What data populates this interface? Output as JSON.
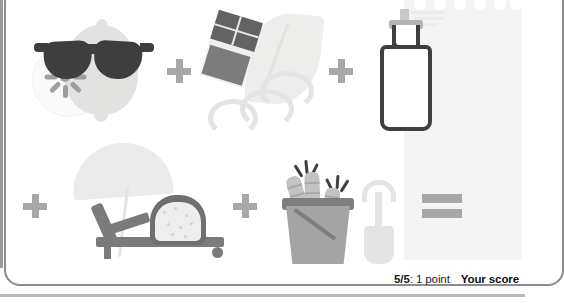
{
  "card": {
    "accent_gray": "#a8a8a8",
    "dark_ink": "#3e3e3e"
  },
  "puzzle": {
    "rows": [
      {
        "id": "row-1",
        "items": [
          {
            "type": "icon",
            "name": "lemon-sunglasses-icon",
            "label": "lemon wearing sunglasses"
          },
          {
            "type": "operator",
            "name": "plus-operator",
            "label": "+"
          },
          {
            "type": "icon",
            "name": "chocolate-feather-icon",
            "label": "chocolate bar with feather"
          },
          {
            "type": "operator",
            "name": "plus-operator",
            "label": "+"
          },
          {
            "type": "icon",
            "name": "milk-bottle-spray-icon",
            "label": "milk bottle with spray"
          }
        ]
      },
      {
        "id": "row-2",
        "items": [
          {
            "type": "operator",
            "name": "plus-operator",
            "label": "+"
          },
          {
            "type": "icon",
            "name": "sun-lounger-bread-icon",
            "label": "sun lounger with bread slice"
          },
          {
            "type": "operator",
            "name": "plus-operator",
            "label": "+"
          },
          {
            "type": "icon",
            "name": "bucket-carrots-spade-icon",
            "label": "bucket with carrots and spade"
          },
          {
            "type": "operator",
            "name": "equals-operator",
            "label": "="
          }
        ]
      }
    ]
  },
  "answer_panel": {
    "name": "answer-area",
    "background": "#f4f4f4",
    "dot_count": 6
  },
  "footer": {
    "score_progress": "5/5",
    "score_points": "1 point",
    "score_separator": ": ",
    "score_title": "Your score"
  }
}
